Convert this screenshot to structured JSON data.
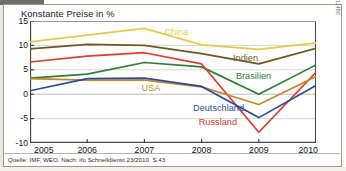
{
  "figure": {
    "title": "Konstante Preise in %",
    "source": "Quelle: IMF, WEO. Nach: ifo Schnelldienst 23/2010, S.43",
    "code_id": "2011486"
  },
  "chart_data": {
    "type": "line",
    "title": "Konstante Preise in %",
    "xlabel": "",
    "ylabel": "",
    "x": [
      "2005",
      "2006",
      "2007",
      "2008",
      "2009",
      "2010"
    ],
    "categories": [
      "2005",
      "2006",
      "2007",
      "2008",
      "2009",
      "2010"
    ],
    "xlim": [
      2005,
      2010
    ],
    "ylim": [
      -10,
      15
    ],
    "yticks": [
      "15",
      "10",
      "5",
      "0",
      "-5",
      "-10"
    ],
    "ytick_values": [
      15,
      10,
      5,
      0,
      -5,
      -10
    ],
    "grid": true,
    "legend_position": "inline-labels",
    "series": [
      {
        "name": "China",
        "color": "#e3cc47",
        "values": [
          10.7,
          12.1,
          13.5,
          10.1,
          9.2,
          10.5
        ],
        "label_x": 2007.35,
        "label_y": 12.5
      },
      {
        "name": "Indien",
        "color": "#6b5a20",
        "values": [
          9.3,
          10.2,
          10.0,
          8.3,
          6.2,
          9.4
        ],
        "label_x": 2008.55,
        "label_y": 7.3
      },
      {
        "name": "Brasilien",
        "color": "#2f7d35",
        "values": [
          3.3,
          4.1,
          6.5,
          5.6,
          0.0,
          6.0
        ],
        "label_x": 2008.6,
        "label_y": 3.5
      },
      {
        "name": "Russland",
        "color": "#e23a2d",
        "values": [
          6.6,
          7.8,
          8.5,
          6.2,
          -7.8,
          4.5
        ],
        "label_x": 2007.95,
        "label_y": -6.0
      },
      {
        "name": "USA",
        "color": "#c5862c",
        "values": [
          3.2,
          2.9,
          2.9,
          1.5,
          -2.1,
          3.6
        ],
        "label_x": 2006.95,
        "label_y": 1.0
      },
      {
        "name": "Deutschland",
        "color": "#2a4b9b",
        "values": [
          0.7,
          3.2,
          3.3,
          1.6,
          -4.8,
          1.8
        ],
        "label_x": 2007.85,
        "label_y": -3.1
      }
    ]
  }
}
